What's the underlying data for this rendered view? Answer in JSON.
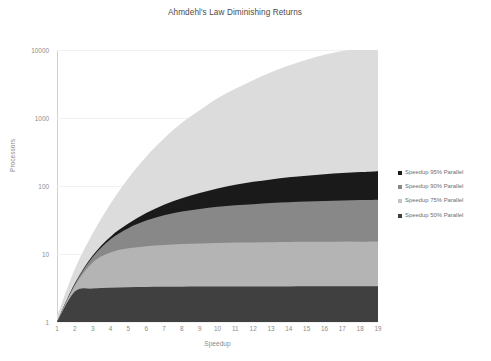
{
  "chart_data": {
    "type": "area",
    "stacked": true,
    "title": "Ahmdehl's Law Diminishing Returns",
    "xlabel": "Speedup",
    "ylabel": "Processors",
    "yscale": "log",
    "ylim": [
      1,
      10000
    ],
    "xlim": [
      1,
      19
    ],
    "grid": true,
    "legend_position": "right",
    "y_ticks": [
      "1",
      "10",
      "100",
      "1000",
      "10000"
    ],
    "y_tick_values": [
      1,
      10,
      100,
      1000,
      10000
    ],
    "x_ticks": [
      "1",
      "2",
      "3",
      "4",
      "5",
      "6",
      "7",
      "8",
      "9",
      "10",
      "11",
      "12",
      "13",
      "14",
      "15",
      "16",
      "17",
      "18",
      "19"
    ],
    "x": [
      1,
      2,
      3,
      4,
      5,
      6,
      7,
      8,
      9,
      10,
      11,
      12,
      13,
      14,
      15,
      16,
      17,
      18,
      19
    ],
    "series": [
      {
        "name": "Speedup 50% Parallel",
        "color": "#404040",
        "parallel_fraction": 0.5,
        "values": [
          1,
          2.8,
          3.1,
          3.2,
          3.25,
          3.28,
          3.3,
          3.31,
          3.32,
          3.33,
          3.33,
          3.34,
          3.34,
          3.34,
          3.35,
          3.35,
          3.35,
          3.35,
          3.35
        ]
      },
      {
        "name": "Speedup 75% Parallel",
        "color": "#b4b4b4",
        "parallel_fraction": 0.75,
        "values": [
          1,
          3.4,
          7.5,
          10.5,
          12.1,
          13.0,
          13.6,
          14.0,
          14.3,
          14.5,
          14.7,
          14.8,
          14.9,
          15.0,
          15.1,
          15.1,
          15.2,
          15.2,
          15.3
        ]
      },
      {
        "name": "Speedup 90% Parallel",
        "color": "#888888",
        "parallel_fraction": 0.9,
        "values": [
          1,
          3.6,
          9.0,
          16.5,
          24.0,
          31.0,
          37.0,
          42.0,
          46.0,
          49.5,
          52.0,
          54.0,
          56.0,
          57.5,
          59.0,
          60.0,
          61.0,
          62.0,
          63.0
        ]
      },
      {
        "name": "Speedup 95% Parallel",
        "color": "#1a1a1a",
        "parallel_fraction": 0.95,
        "values": [
          1,
          3.7,
          9.5,
          18.0,
          28.0,
          40.0,
          53.0,
          66.0,
          79.0,
          92.0,
          104.0,
          115.0,
          125.0,
          134.0,
          142.0,
          149.0,
          155.0,
          160.0,
          165.0
        ]
      },
      {
        "name": "Speedup upper envelope",
        "color": "#dcdcdc",
        "values": [
          1.2,
          6.0,
          20.0,
          55.0,
          130.0,
          270.0,
          500.0,
          850.0,
          1300.0,
          1950.0,
          2700.0,
          3600.0,
          4700.0,
          5900.0,
          7200.0,
          8500.0,
          9700.0,
          10500.0,
          11000.0
        ]
      }
    ]
  },
  "legend": {
    "items": [
      {
        "label": "Speedup 95% Parallel",
        "color": "#1a1a1a"
      },
      {
        "label": "Speedup 90% Parallel",
        "color": "#888888"
      },
      {
        "label": "Speedup 75% Parallel",
        "color": "#c4c4c4"
      },
      {
        "label": "Speedup 50% Parallel",
        "color": "#404040"
      }
    ]
  }
}
